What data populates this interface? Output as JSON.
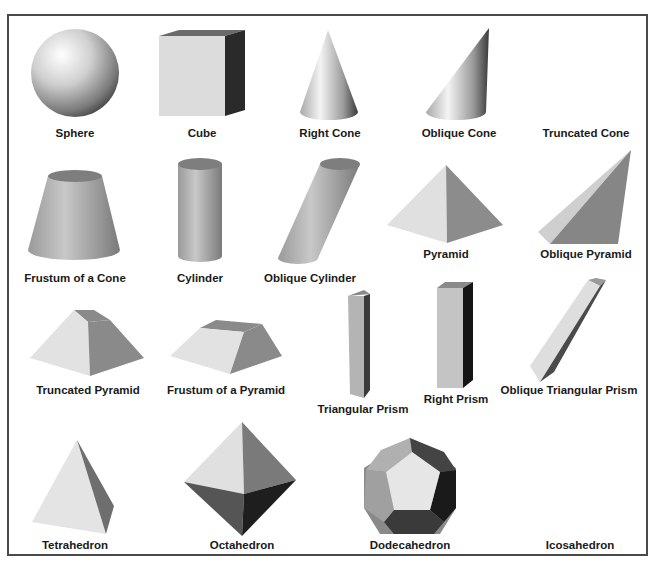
{
  "colors": {
    "border": "#4a4a4a",
    "label": "#1a1a1a",
    "light": "#e4e4e4",
    "mid": "#9a9a9a",
    "dark": "#5a5a5a",
    "darkest": "#2a2a2a"
  },
  "shapes": [
    {
      "id": "sphere",
      "label": "Sphere",
      "label_x": 75,
      "label_y": 127
    },
    {
      "id": "cube",
      "label": "Cube",
      "label_x": 202,
      "label_y": 127
    },
    {
      "id": "right-cone",
      "label": "Right Cone",
      "label_x": 330,
      "label_y": 127
    },
    {
      "id": "oblique-cone",
      "label": "Oblique Cone",
      "label_x": 459,
      "label_y": 127
    },
    {
      "id": "truncated-cone",
      "label": "Truncated Cone",
      "label_x": 586,
      "label_y": 127
    },
    {
      "id": "frustum-cone",
      "label": "Frustum of a Cone",
      "label_x": 75,
      "label_y": 272
    },
    {
      "id": "cylinder",
      "label": "Cylinder",
      "label_x": 200,
      "label_y": 272
    },
    {
      "id": "oblique-cylinder",
      "label": "Oblique Cylinder",
      "label_x": 310,
      "label_y": 272
    },
    {
      "id": "pyramid",
      "label": "Pyramid",
      "label_x": 446,
      "label_y": 248
    },
    {
      "id": "oblique-pyramid",
      "label": "Oblique Pyramid",
      "label_x": 586,
      "label_y": 248
    },
    {
      "id": "truncated-pyramid",
      "label": "Truncated Pyramid",
      "label_x": 88,
      "label_y": 384
    },
    {
      "id": "frustum-pyramid",
      "label": "Frustum of a Pyramid",
      "label_x": 226,
      "label_y": 384
    },
    {
      "id": "triangular-prism",
      "label": "Triangular Prism",
      "label_x": 363,
      "label_y": 403
    },
    {
      "id": "right-prism",
      "label": "Right Prism",
      "label_x": 456,
      "label_y": 393
    },
    {
      "id": "oblique-triangular-prism",
      "label": "Oblique Triangular Prism",
      "label_x": 569,
      "label_y": 384
    },
    {
      "id": "tetrahedron",
      "label": "Tetrahedron",
      "label_x": 75,
      "label_y": 539
    },
    {
      "id": "octahedron",
      "label": "Octahedron",
      "label_x": 242,
      "label_y": 539
    },
    {
      "id": "dodecahedron",
      "label": "Dodecahedron",
      "label_x": 410,
      "label_y": 539
    },
    {
      "id": "icosahedron",
      "label": "Icosahedron",
      "label_x": 580,
      "label_y": 539
    }
  ]
}
